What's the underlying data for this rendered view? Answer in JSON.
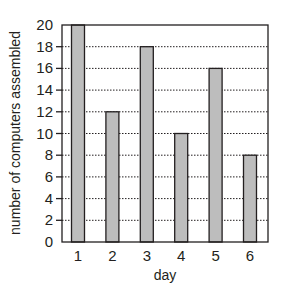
{
  "chart_data": {
    "type": "bar",
    "title": "",
    "xlabel": "day",
    "ylabel": "number of computers assembled",
    "categories": [
      "1",
      "2",
      "3",
      "4",
      "5",
      "6"
    ],
    "values": [
      20,
      12,
      18,
      10,
      16,
      8
    ],
    "ylim": [
      0,
      20
    ],
    "yticks": [
      0,
      2,
      4,
      6,
      8,
      10,
      12,
      14,
      16,
      18,
      20
    ],
    "grid": "horizontal dotted",
    "legend": null,
    "colors": {
      "bar_fill": "#bdbdbd",
      "bar_stroke": "#231f20",
      "axis": "#231f20",
      "grid": "#231f20"
    }
  }
}
